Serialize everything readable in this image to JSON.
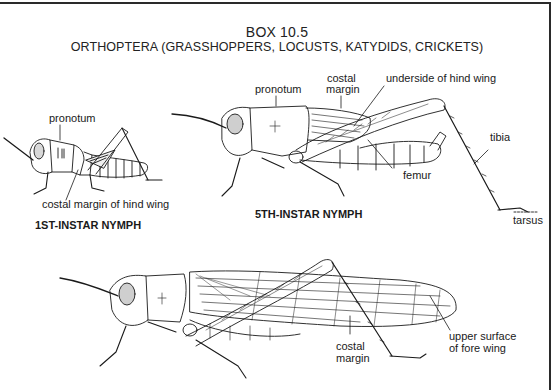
{
  "header": {
    "box_number": "BOX 10.5",
    "subtitle": "ORTHOPTERA (GRASSHOPPERS, LOCUSTS, KATYDIDS, CRICKETS)"
  },
  "figures": {
    "first_instar": {
      "stage_label": "1ST-INSTAR NYMPH",
      "labels": {
        "pronotum": "pronotum",
        "costal_margin_hind_wing": "costal margin of hind wing"
      }
    },
    "fifth_instar": {
      "stage_label": "5TH-INSTAR NYMPH",
      "labels": {
        "pronotum": "pronotum",
        "costal_margin_line1": "costal",
        "costal_margin_line2": "margin",
        "underside_hind_wing": "underside of hind wing",
        "tibia": "tibia",
        "femur": "femur",
        "tarsus": "tarsus"
      }
    },
    "adult": {
      "labels": {
        "costal_margin_line1": "costal",
        "costal_margin_line2": "margin",
        "upper_surface_line1": "upper surface",
        "upper_surface_line2": "of fore wing"
      }
    }
  },
  "colors": {
    "ink": "#1a1a1a",
    "background": "#ffffff"
  }
}
